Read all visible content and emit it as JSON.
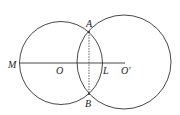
{
  "diagram": {
    "labels": {
      "A": "A",
      "B": "B",
      "M": "M",
      "O": "O",
      "L": "L",
      "O2": "O′"
    },
    "circles": [
      {
        "name": "circle-O",
        "cx": 61,
        "cy": 63,
        "r": 41
      },
      {
        "name": "circle-O-prime",
        "cx": 124,
        "cy": 62,
        "r": 47
      }
    ],
    "colors": {
      "stroke": "#333333"
    }
  }
}
